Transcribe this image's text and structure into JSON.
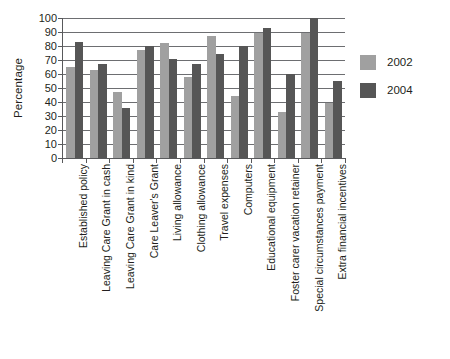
{
  "chart_data": {
    "type": "bar",
    "title": "",
    "subtitle": "",
    "xlabel": "",
    "ylabel": "Percentage",
    "ylim": [
      0,
      100
    ],
    "yticks": [
      0,
      10,
      20,
      30,
      40,
      50,
      60,
      70,
      80,
      90,
      100
    ],
    "grid": true,
    "legend_position": "right",
    "categories": [
      "Established policy",
      "Leaving Care Grant in cash",
      "Leaving Care Grant in kind",
      "Care Leaver's Grant",
      "Living allowance",
      "Clothing allowance",
      "Travel expenses",
      "Computers",
      "Educational equipment",
      "Foster carer vacation retainer",
      "Special circumstances payment",
      "Extra financial incentives"
    ],
    "series": [
      {
        "name": "2002",
        "color": "#a0a0a0",
        "values": [
          65,
          63,
          47,
          77,
          82,
          58,
          87,
          44,
          89,
          33,
          89,
          39
        ]
      },
      {
        "name": "2004",
        "color": "#565656",
        "values": [
          83,
          67,
          36,
          80,
          71,
          67,
          74,
          80,
          93,
          60,
          100,
          55
        ]
      }
    ]
  },
  "legend": {
    "items": [
      {
        "label": "2002",
        "color": "#a0a0a0"
      },
      {
        "label": "2004",
        "color": "#565656"
      }
    ]
  },
  "axes": {
    "y_title": "Percentage"
  }
}
